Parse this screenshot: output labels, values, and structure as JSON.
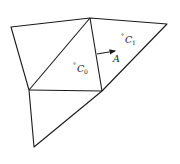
{
  "diagram": {
    "type": "triangular-mesh",
    "vertices": {
      "v_top_left": [
        11,
        27
      ],
      "v_top_center": [
        90,
        18
      ],
      "v_top_right": [
        167,
        24
      ],
      "v_left_mid": [
        29,
        90
      ],
      "v_center_right": [
        102,
        91
      ],
      "v_bottom": [
        34,
        147
      ]
    },
    "cells": [
      {
        "id": "T_left",
        "vertices": [
          "v_top_left",
          "v_top_center",
          "v_left_mid"
        ]
      },
      {
        "id": "C0",
        "vertices": [
          "v_top_center",
          "v_left_mid",
          "v_center_right"
        ]
      },
      {
        "id": "C1",
        "vertices": [
          "v_top_center",
          "v_top_right",
          "v_center_right"
        ]
      },
      {
        "id": "T_bottom",
        "vertices": [
          "v_left_mid",
          "v_center_right",
          "v_bottom"
        ]
      }
    ],
    "labels": {
      "c0": {
        "prefix": "°",
        "main": "C",
        "sub": "0"
      },
      "c1": {
        "prefix": "°",
        "main": "C",
        "sub": "1"
      },
      "face_normal": {
        "main": "A"
      }
    },
    "arrow": {
      "from": [
        97,
        54
      ],
      "to": [
        114,
        51
      ],
      "label": "A"
    }
  }
}
